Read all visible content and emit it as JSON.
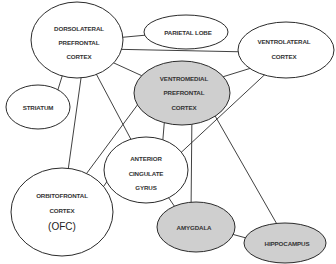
{
  "diagram": {
    "title": "",
    "colors": {
      "white_fill": "#ffffff",
      "gray_fill": "#cfcfcf",
      "stroke": "#2b2b2b",
      "text": "#333333"
    },
    "nodes": [
      {
        "id": "dlpfc",
        "lines": [
          "DORSOLATERAL",
          "PREFRONTAL",
          "CORTEX"
        ],
        "fill": "white"
      },
      {
        "id": "parietal",
        "lines": [
          "PARIETAL LOBE"
        ],
        "fill": "white"
      },
      {
        "id": "vlc",
        "lines": [
          "VENTROLATERAL",
          "CORTEX"
        ],
        "fill": "white"
      },
      {
        "id": "striatum",
        "lines": [
          "STRIATUM"
        ],
        "fill": "white"
      },
      {
        "id": "vmpfc",
        "lines": [
          "VENTROMEDIAL",
          "PREFRONTAL",
          "CORTEX"
        ],
        "fill": "gray"
      },
      {
        "id": "acg",
        "lines": [
          "ANTERIOR",
          "CINGULATE",
          "GYRUS"
        ],
        "fill": "white"
      },
      {
        "id": "ofc",
        "lines": [
          "ORBITOFRONTAL",
          "CORTEX",
          "(OFC)"
        ],
        "fill": "white"
      },
      {
        "id": "amygdala",
        "lines": [
          "AMYGDALA"
        ],
        "fill": "gray"
      },
      {
        "id": "hippocampus",
        "lines": [
          "HIPPOCAMPUS"
        ],
        "fill": "gray"
      }
    ],
    "edges": [
      {
        "from": "dlpfc",
        "to": "parietal",
        "direction": "both"
      },
      {
        "from": "dlpfc",
        "to": "vlc",
        "direction": "both"
      },
      {
        "from": "dlpfc",
        "to": "vmpfc",
        "direction": "both"
      },
      {
        "from": "dlpfc",
        "to": "striatum",
        "direction": "both"
      },
      {
        "from": "dlpfc",
        "to": "ofc",
        "direction": "both"
      },
      {
        "from": "dlpfc",
        "to": "acg",
        "direction": "both"
      },
      {
        "from": "vlc",
        "to": "vmpfc",
        "direction": "both"
      },
      {
        "from": "vlc",
        "to": "acg",
        "direction": "both"
      },
      {
        "from": "vmpfc",
        "to": "ofc",
        "direction": "both"
      },
      {
        "from": "vmpfc",
        "to": "acg",
        "direction": "both"
      },
      {
        "from": "vmpfc",
        "to": "amygdala",
        "direction": "both"
      },
      {
        "from": "vmpfc",
        "to": "hippocampus",
        "direction": "both"
      },
      {
        "from": "acg",
        "to": "ofc",
        "direction": "both"
      },
      {
        "from": "acg",
        "to": "amygdala",
        "direction": "both"
      },
      {
        "from": "amygdala",
        "to": "hippocampus",
        "direction": "both"
      }
    ]
  }
}
